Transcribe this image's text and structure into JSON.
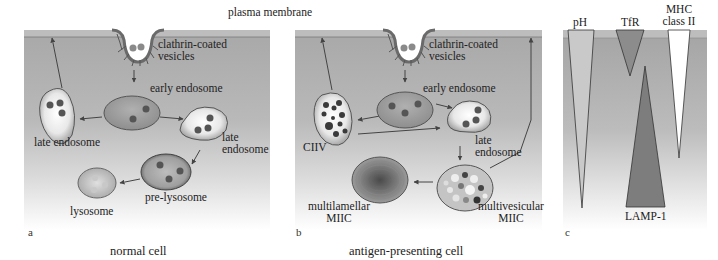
{
  "figure": {
    "top_label": "plasma membrane",
    "colors": {
      "cytoplasm_top": "#a9a9a9",
      "cytoplasm_bottom": "#ffffff",
      "membrane": "#b8b8b8",
      "organelle_fill": "#9e9e9e",
      "cargo_dot": "#5a5a5a",
      "lamp1": "#7d7d7d",
      "tfr": "#8c8c8c",
      "ph": "#c8c8c8",
      "mhc": "#ffffff"
    }
  },
  "panel_a": {
    "letter": "a",
    "caption": "normal cell",
    "labels": {
      "clathrin": "clathrin-coated",
      "clathrin2": "vesicles",
      "early": "early endosome",
      "late_left": "late endosome",
      "late_right_1": "late",
      "late_right_2": "endosome",
      "pre_lysosome": "pre-lysosome",
      "lysosome": "lysosome"
    }
  },
  "panel_b": {
    "letter": "b",
    "caption": "antigen-presenting cell",
    "labels": {
      "clathrin": "clathrin-coated",
      "clathrin2": "vesicles",
      "early": "early endosome",
      "ciiv": "CIIV",
      "late_1": "late",
      "late_2": "endosome",
      "multilamellar_1": "multilamellar",
      "multilamellar_2": "MIIC",
      "multivesicular_1": "multivesicular",
      "multivesicular_2": "MIIC"
    }
  },
  "panel_c": {
    "letter": "c",
    "labels": {
      "ph": "pH",
      "tfr": "TfR",
      "mhc_1": "MHC",
      "mhc_2": "class II",
      "lamp1": "LAMP-1"
    }
  }
}
